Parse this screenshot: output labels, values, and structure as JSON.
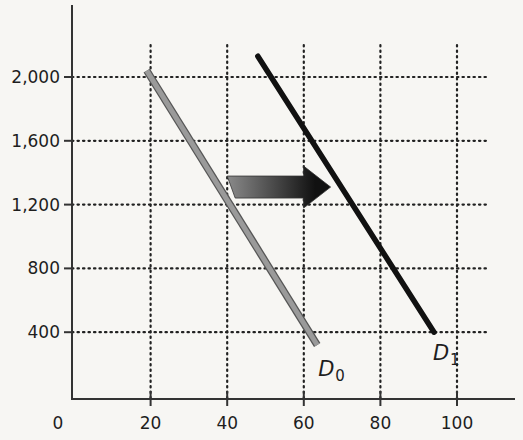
{
  "chart_data": {
    "type": "line",
    "title": "",
    "xlabel": "",
    "ylabel": "",
    "x_ticks": [
      0,
      20,
      40,
      60,
      80,
      100
    ],
    "x_tick_labels": [
      "0",
      "20",
      "40",
      "60",
      "80",
      "100"
    ],
    "y_ticks": [
      400,
      800,
      1200,
      1600,
      2000
    ],
    "y_tick_labels": [
      "400",
      "800",
      "1,200",
      "1,600",
      "2,000"
    ],
    "xlim": [
      0,
      115
    ],
    "ylim": [
      0,
      2450
    ],
    "grid": "dotted",
    "legend": "none (inline labels at line ends)",
    "series": [
      {
        "name": "D0",
        "label_main": "D",
        "label_sub": "0",
        "color": "#9a9a9a",
        "outline": "#555555",
        "x": [
          19,
          63.5
        ],
        "y": [
          2040,
          320
        ]
      },
      {
        "name": "D1",
        "label_main": "D",
        "label_sub": "1",
        "color": "#111111",
        "x": [
          48,
          94
        ],
        "y": [
          2130,
          400
        ]
      }
    ],
    "annotations": [
      {
        "type": "arrow",
        "direction": "right",
        "meaning": "demand shifts from D0 to D1",
        "from": [
          40,
          1310
        ],
        "to": [
          67,
          1310
        ],
        "gradient": [
          "#8a8a8a",
          "#111111"
        ]
      }
    ]
  }
}
